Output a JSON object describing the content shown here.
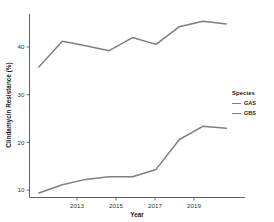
{
  "chart_data": {
    "type": "line",
    "title": "",
    "xlabel": "Year",
    "ylabel": "Clindamycin Resistance (%)",
    "x": [
      2011,
      2012,
      2013,
      2014,
      2015,
      2016,
      2017,
      2018,
      2019
    ],
    "xlim": [
      2010.6,
      2019.8
    ],
    "ylim": [
      8.0,
      48.5
    ],
    "xticks": [
      2013,
      2015,
      2017,
      2019
    ],
    "xtick_labels": [
      "2013",
      "2015",
      "2017",
      "2019"
    ],
    "yticks": [
      10,
      20,
      30,
      40
    ],
    "ytick_labels": [
      "10",
      "20",
      "30",
      "40"
    ],
    "grid": false,
    "legend_position": "right",
    "legend_title": "Species",
    "series": [
      {
        "name": "GAS",
        "color": "#7f7f7f",
        "values": [
          9.0,
          10.8,
          12.0,
          12.6,
          12.6,
          14.2,
          20.8,
          23.7,
          23.3
        ]
      },
      {
        "name": "GBS",
        "color": "#7f7f7f",
        "values": [
          36.8,
          42.5,
          41.5,
          40.4,
          43.3,
          41.8,
          45.7,
          46.9,
          46.3
        ]
      }
    ]
  },
  "axes": {
    "x_title": "Year",
    "y_title": "Clindamycin Resistance (%)"
  },
  "legend": {
    "title": "Species",
    "entries": [
      {
        "label": "GAS",
        "color": "#7f7f7f"
      },
      {
        "label": "GBS",
        "color": "#7f7f7f"
      }
    ]
  },
  "colors": {
    "background": "#ffffff",
    "axis": "#4d4d4d",
    "line": "#7f7f7f",
    "text": "#1a1a1a"
  }
}
